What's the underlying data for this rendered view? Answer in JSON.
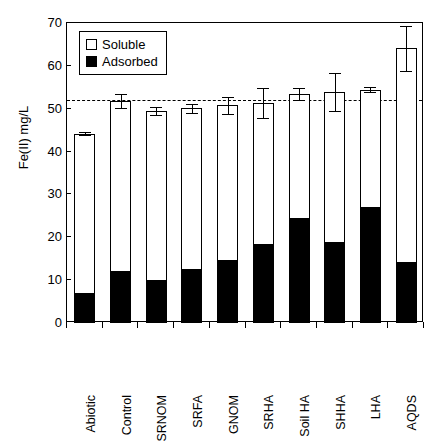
{
  "chart_data": {
    "type": "bar",
    "subtype": "stacked-bar-with-error-bars",
    "title": "",
    "xlabel": "",
    "ylabel": "Fe(II) mg/L",
    "ylim": [
      0,
      70
    ],
    "ytick_values": [
      0,
      10,
      20,
      30,
      40,
      50,
      60,
      70
    ],
    "ytick_labels": [
      "0",
      "10",
      "20",
      "30",
      "40",
      "50",
      "60",
      "70"
    ],
    "grid": false,
    "legend_position": "upper-left-inside",
    "categories": [
      "Abiotic",
      "Control",
      "SRNOM",
      "SRFA",
      "GNOM",
      "SRHA",
      "Soil HA",
      "SHHA",
      "LHA",
      "AQDS"
    ],
    "series": [
      {
        "name": "Adsorbed",
        "fill": "#000000",
        "edge": "#000000",
        "values": [
          7.0,
          12.2,
          10.0,
          12.7,
          14.6,
          18.4,
          24.6,
          19.0,
          27.0,
          14.3
        ]
      },
      {
        "name": "Soluble",
        "fill": "#ffffff",
        "edge": "#000000",
        "values": [
          37.2,
          39.6,
          39.4,
          37.4,
          36.2,
          33.0,
          28.9,
          34.9,
          27.4,
          49.8
        ]
      }
    ],
    "totals": [
      44.2,
      51.8,
      49.4,
      50.1,
      50.8,
      51.4,
      53.5,
      53.9,
      54.4,
      64.1
    ],
    "total_errors": [
      0.3,
      1.6,
      0.9,
      1.0,
      2.0,
      3.5,
      1.4,
      4.5,
      0.6,
      5.2
    ],
    "reference_line": {
      "value": 52.0,
      "style": "dashed",
      "color": "#000000"
    }
  },
  "legend": {
    "items": [
      {
        "label": "Soluble",
        "swatch": "hollow"
      },
      {
        "label": "Adsorbed",
        "swatch": "filled"
      }
    ]
  }
}
